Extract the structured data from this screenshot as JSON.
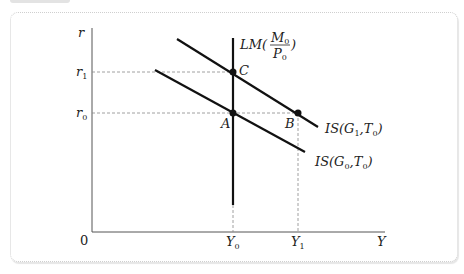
{
  "diagram": {
    "axes": {
      "y_label": "r",
      "x_label": "Y",
      "origin_label": "0"
    },
    "y_ticks": [
      {
        "label": "r",
        "sub": "1",
        "y_px": 72
      },
      {
        "label": "r",
        "sub": "0",
        "y_px": 113
      }
    ],
    "x_ticks": [
      {
        "label": "Y",
        "sub": "0",
        "x_px": 233
      },
      {
        "label": "Y",
        "sub": "1",
        "x_px": 298
      }
    ],
    "curves": {
      "lm": {
        "label_prefix": "LM(",
        "numerator": "M",
        "numerator_sub": "0",
        "denominator": "P",
        "denominator_sub": "0",
        "label_suffix": ")"
      },
      "is_g1": {
        "label_prefix": "IS(G",
        "g_sub": "1",
        "mid": ",T",
        "t_sub": "0",
        "label_suffix": ")"
      },
      "is_g0": {
        "label_prefix": "IS(G",
        "g_sub": "0",
        "mid": ",T",
        "t_sub": "0",
        "label_suffix": ")"
      }
    },
    "points": [
      {
        "label": "C",
        "x_px": 233,
        "y_px": 72
      },
      {
        "label": "A",
        "x_px": 233,
        "y_px": 113
      },
      {
        "label": "B",
        "x_px": 298,
        "y_px": 113
      }
    ],
    "colors": {
      "line": "#111111",
      "axis": "#555555",
      "dashed": "#888888",
      "border": "#cfcfcf"
    }
  }
}
